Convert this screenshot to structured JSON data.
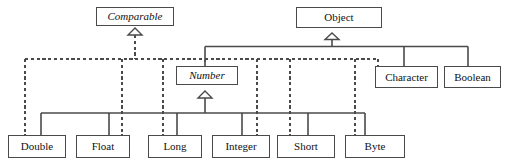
{
  "diagram": {
    "type": "uml-class-hierarchy",
    "stroke_color": "#4a4a4a",
    "text_color": "#111111",
    "background": "#ffffff",
    "nodes": [
      {
        "id": "comparable",
        "label": "Comparable",
        "kind": "interface",
        "italic": true,
        "x": 96,
        "y": 7,
        "w": 78,
        "h": 19
      },
      {
        "id": "object",
        "label": "Object",
        "kind": "class",
        "italic": false,
        "x": 296,
        "y": 7,
        "w": 86,
        "h": 21
      },
      {
        "id": "number",
        "label": "Number",
        "kind": "abstract",
        "italic": true,
        "x": 176,
        "y": 66,
        "w": 62,
        "h": 19
      },
      {
        "id": "character",
        "label": "Character",
        "kind": "class",
        "italic": false,
        "x": 375,
        "y": 66,
        "w": 63,
        "h": 22
      },
      {
        "id": "boolean",
        "label": "Boolean",
        "kind": "class",
        "italic": false,
        "x": 444,
        "y": 66,
        "w": 57,
        "h": 22
      },
      {
        "id": "double",
        "label": "Double",
        "kind": "class",
        "italic": false,
        "x": 8,
        "y": 135,
        "w": 58,
        "h": 23
      },
      {
        "id": "float",
        "label": "Float",
        "kind": "class",
        "italic": false,
        "x": 76,
        "y": 135,
        "w": 54,
        "h": 23
      },
      {
        "id": "long",
        "label": "Long",
        "kind": "class",
        "italic": false,
        "x": 148,
        "y": 135,
        "w": 54,
        "h": 23
      },
      {
        "id": "integer",
        "label": "Integer",
        "kind": "class",
        "italic": false,
        "x": 212,
        "y": 135,
        "w": 58,
        "h": 23
      },
      {
        "id": "short",
        "label": "Short",
        "kind": "class",
        "italic": false,
        "x": 277,
        "y": 135,
        "w": 58,
        "h": 23
      },
      {
        "id": "byte",
        "label": "Byte",
        "kind": "class",
        "italic": false,
        "x": 345,
        "y": 135,
        "w": 60,
        "h": 23
      }
    ],
    "relations": [
      {
        "from": "double",
        "to": "comparable",
        "style": "dashed",
        "kind": "realization"
      },
      {
        "from": "float",
        "to": "comparable",
        "style": "dashed",
        "kind": "realization"
      },
      {
        "from": "long",
        "to": "comparable",
        "style": "dashed",
        "kind": "realization"
      },
      {
        "from": "integer",
        "to": "comparable",
        "style": "dashed",
        "kind": "realization"
      },
      {
        "from": "short",
        "to": "comparable",
        "style": "dashed",
        "kind": "realization"
      },
      {
        "from": "byte",
        "to": "comparable",
        "style": "dashed",
        "kind": "realization"
      },
      {
        "from": "character",
        "to": "comparable",
        "style": "dashed",
        "kind": "realization"
      },
      {
        "from": "number",
        "to": "object",
        "style": "solid",
        "kind": "generalization"
      },
      {
        "from": "character",
        "to": "object",
        "style": "solid",
        "kind": "generalization"
      },
      {
        "from": "boolean",
        "to": "object",
        "style": "solid",
        "kind": "generalization"
      },
      {
        "from": "double",
        "to": "number",
        "style": "solid",
        "kind": "generalization"
      },
      {
        "from": "float",
        "to": "number",
        "style": "solid",
        "kind": "generalization"
      },
      {
        "from": "long",
        "to": "number",
        "style": "solid",
        "kind": "generalization"
      },
      {
        "from": "integer",
        "to": "number",
        "style": "solid",
        "kind": "generalization"
      },
      {
        "from": "short",
        "to": "number",
        "style": "solid",
        "kind": "generalization"
      },
      {
        "from": "byte",
        "to": "number",
        "style": "solid",
        "kind": "generalization"
      }
    ]
  }
}
